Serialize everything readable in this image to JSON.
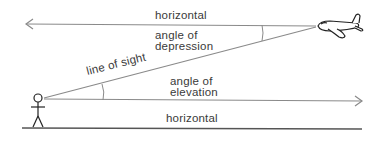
{
  "diagram": {
    "labels": {
      "top_horizontal": "horizontal",
      "depression_line1": "angle of",
      "depression_line2": "depression",
      "line_of_sight": "line of sight",
      "elevation_line1": "angle of",
      "elevation_line2": "elevation",
      "bottom_horizontal": "horizontal"
    },
    "figures": {
      "observer": "stick-figure-person",
      "target": "airplane"
    },
    "colors": {
      "line": "#8a8a8a",
      "ground": "#555555",
      "text": "#3a3a3a",
      "figure": "#222222"
    }
  }
}
